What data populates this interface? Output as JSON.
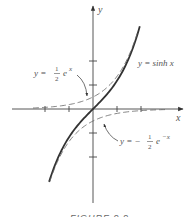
{
  "chart_data": {
    "type": "line",
    "title": "",
    "caption": "FIGURE 9.9",
    "xlabel": "x",
    "ylabel": "y",
    "xlim": [
      -3.4,
      3.8
    ],
    "ylim": [
      -3.9,
      4.3
    ],
    "grid": false,
    "x_ticks": [
      -2,
      -1,
      0,
      1,
      2
    ],
    "y_ticks": [
      -2,
      -1,
      0,
      1,
      2
    ],
    "series": [
      {
        "name": "y = sinh x",
        "style": "solid",
        "function": "sinh(x)",
        "x_range": [
          -1.83,
          1.95
        ],
        "x": [
          -1.83,
          -1.5,
          -1.0,
          -0.5,
          0,
          0.5,
          1.0,
          1.5,
          1.95
        ],
        "values": [
          -3.04,
          -2.13,
          -1.18,
          -0.52,
          0,
          0.52,
          1.18,
          2.13,
          3.44
        ]
      },
      {
        "name": "y = 1/2 e^x",
        "style": "dashed",
        "function": "0.5*exp(x)",
        "x_range": [
          -2.5,
          1.85
        ],
        "x": [
          -2.5,
          -2.0,
          -1.0,
          0,
          1.0,
          1.5,
          1.85
        ],
        "values": [
          0.04,
          0.07,
          0.18,
          0.5,
          1.36,
          2.24,
          3.18
        ]
      },
      {
        "name": "y = -1/2 e^-x",
        "style": "dashed",
        "function": "-0.5*exp(-x)",
        "x_range": [
          -1.8,
          3.0
        ],
        "x": [
          -1.8,
          -1.5,
          -1.0,
          0,
          1.0,
          2.0,
          3.0
        ],
        "values": [
          -3.02,
          -2.24,
          -1.36,
          -0.5,
          -0.18,
          -0.07,
          -0.02
        ]
      }
    ],
    "annotations": [
      {
        "text_prefix": "y = ",
        "numerator": "1",
        "denominator": "2",
        "text_suffix": "e",
        "exponent": "x",
        "arrow_to": "y = 1/2 e^x"
      },
      {
        "text": "y = sinh x"
      },
      {
        "text_prefix": "y = − ",
        "numerator": "1",
        "denominator": "2",
        "text_suffix": "e",
        "exponent": "−x",
        "arrow_to": "y = -1/2 e^-x"
      }
    ]
  }
}
